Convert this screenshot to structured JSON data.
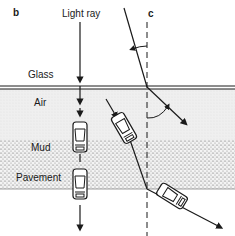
{
  "figure": {
    "panels": [
      {
        "id": "b",
        "label": "b"
      },
      {
        "id": "c",
        "label": "c"
      }
    ],
    "labels": {
      "light_ray": "Light ray",
      "glass": "Glass",
      "air": "Air",
      "mud": "Mud",
      "pavement": "Pavement"
    },
    "layers": [
      {
        "name": "Glass",
        "fill": "#ffffff"
      },
      {
        "name": "Air",
        "fill": "#ececec",
        "texture": "fine-dots"
      },
      {
        "name": "Mud",
        "fill": "#e4e4e4",
        "texture": "coarse-dots"
      },
      {
        "name": "Pavement",
        "fill": "#ffffff"
      }
    ],
    "colors": {
      "ink": "#1a1a1a",
      "background": "#ffffff"
    }
  }
}
